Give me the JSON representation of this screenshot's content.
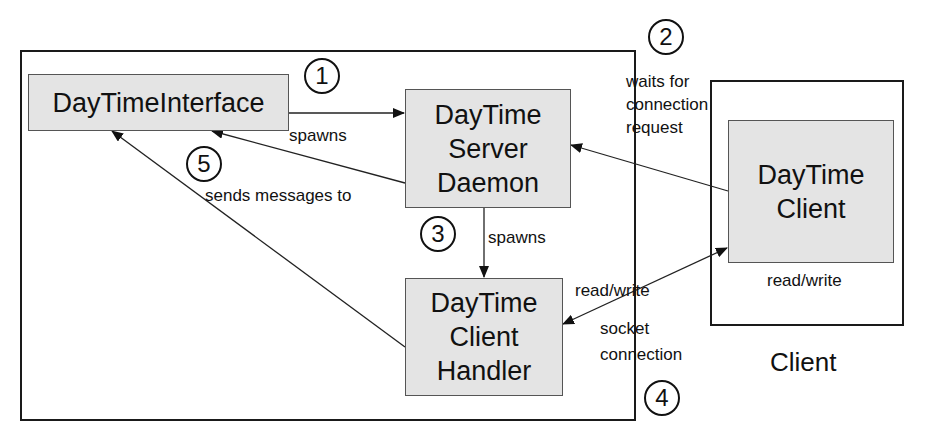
{
  "diagram": {
    "server_container": {
      "label": ""
    },
    "client_container": {
      "label": "Client"
    },
    "nodes": {
      "interface": {
        "lines": [
          "DayTimeInterface"
        ]
      },
      "daemon": {
        "lines": [
          "DayTime",
          "Server",
          "Daemon"
        ]
      },
      "handler": {
        "lines": [
          "DayTime",
          "Client",
          "Handler"
        ]
      },
      "client": {
        "lines": [
          "DayTime",
          "Client"
        ]
      }
    },
    "steps": [
      "1",
      "2",
      "3",
      "4",
      "5"
    ],
    "edges": {
      "spawns_daemon": "spawns",
      "waits_for": [
        "waits for",
        "connection",
        "request"
      ],
      "spawns_handler": "spawns",
      "read_write_server": "read/write",
      "socket_connection": [
        "socket",
        "connection"
      ],
      "read_write_client": "read/write",
      "sends_messages": "sends messages to"
    },
    "colors": {
      "node_fill": "#e4e4e4",
      "stroke": "#1a1a1a"
    }
  }
}
